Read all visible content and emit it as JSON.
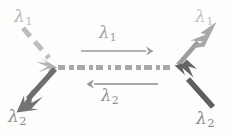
{
  "figure": {
    "background_color": "#fdfdfc"
  },
  "labels": {
    "incoming_left_l1": {
      "symbol": "λ",
      "subscript": "1",
      "color": "#b8b8b8"
    },
    "outgoing_left_l2": {
      "symbol": "λ",
      "subscript": "2",
      "color": "#8e8e8e"
    },
    "outgoing_right_l1": {
      "symbol": "λ",
      "subscript": "1",
      "color": "#c2c2c2"
    },
    "incoming_right_l2": {
      "symbol": "λ",
      "subscript": "2",
      "color": "#8a8a8a"
    },
    "axis_forward_l1": {
      "symbol": "λ",
      "subscript": "1",
      "color": "#9b9b9b"
    },
    "axis_backward_l2": {
      "symbol": "λ",
      "subscript": "2",
      "color": "#8f8f8f"
    }
  },
  "geometry": {
    "left_vertex": {
      "x": 57,
      "y": 67
    },
    "right_vertex": {
      "x": 176,
      "y": 67
    },
    "axis_dashed_y": 67,
    "forward_arrow_y": 51,
    "backward_arrow_y": 84,
    "forward_arrow_x": [
      81,
      152
    ],
    "backward_arrow_x": [
      88,
      158
    ]
  },
  "colors": {
    "dashed_axis": "#9a9a9a",
    "light_gray": "#bdbdbd",
    "mid_gray": "#9c9c9c",
    "dark_gray": "#6e6e6e",
    "darkest_gray": "#5f5f5f"
  },
  "elements": {
    "incoming_left_arrow": {
      "style": "dashed",
      "direction": "down-right",
      "color": "#bdbdbd"
    },
    "outgoing_left_arrow": {
      "style": "solid",
      "direction": "down-left",
      "color": "#6e6e6e"
    },
    "outgoing_right_arrow": {
      "style": "solid",
      "direction": "up-right",
      "color": "#9c9c9c"
    },
    "incoming_right_arrow": {
      "style": "solid",
      "direction": "up-left",
      "color": "#5f5f5f"
    },
    "axis_forward_arrow": {
      "style": "solid",
      "direction": "right",
      "color": "#9a9a9a"
    },
    "axis_backward_arrow": {
      "style": "solid",
      "direction": "left",
      "color": "#8d8d8d"
    },
    "central_axis": {
      "style": "dashed-thick",
      "direction": "horizontal",
      "color": "#9a9a9a"
    }
  }
}
